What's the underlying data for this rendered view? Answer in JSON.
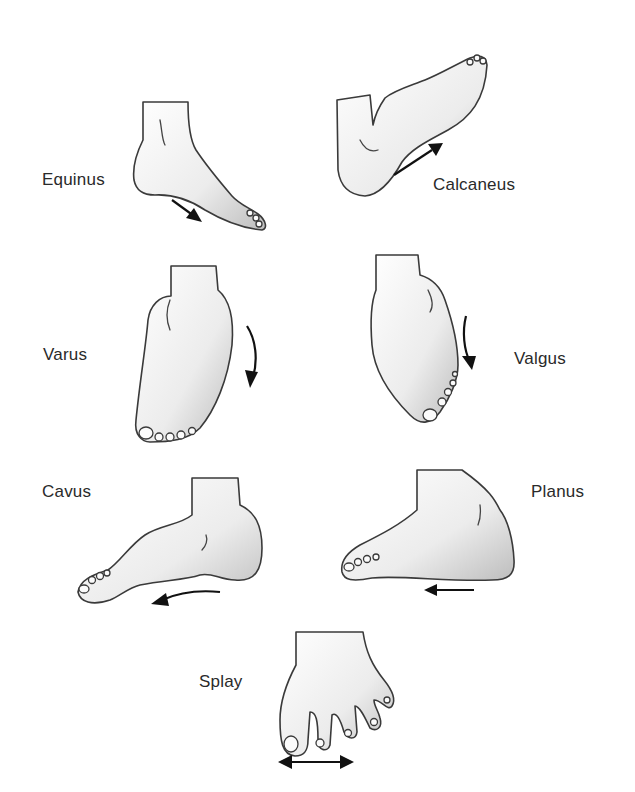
{
  "figure": {
    "type": "foot-deformities-illustration",
    "labels": {
      "equinus": "Equinus",
      "calcaneus": "Calcaneus",
      "varus": "Varus",
      "valgus": "Valgus",
      "cavus": "Cavus",
      "planus": "Planus",
      "splay": "Splay"
    },
    "panels": [
      {
        "id": "equinus",
        "label": "Equinus",
        "arrow": "down-right"
      },
      {
        "id": "calcaneus",
        "label": "Calcaneus",
        "arrow": "up-right"
      },
      {
        "id": "varus",
        "label": "Varus",
        "arrow": "curved-down"
      },
      {
        "id": "valgus",
        "label": "Valgus",
        "arrow": "curved-down"
      },
      {
        "id": "cavus",
        "label": "Cavus",
        "arrow": "curved-left"
      },
      {
        "id": "planus",
        "label": "Planus",
        "arrow": "left"
      },
      {
        "id": "splay",
        "label": "Splay",
        "arrow": "double-horizontal"
      }
    ],
    "colors": {
      "background": "#ffffff",
      "outline": "#3a3a3a",
      "arrow": "#111111",
      "text": "#2a2a2a"
    }
  }
}
